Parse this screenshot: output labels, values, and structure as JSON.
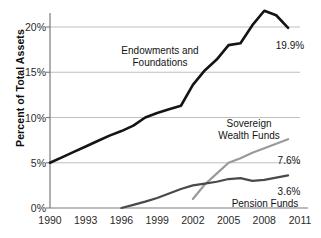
{
  "chart_data": {
    "type": "line",
    "title": "",
    "xlabel": "",
    "ylabel": "Percent of Total Assets",
    "xlim": [
      1990,
      2011
    ],
    "ylim": [
      0,
      22.6
    ],
    "grid": "horizontal",
    "legend_position": "inline-annotations",
    "xticks": [
      "1990",
      "1993",
      "1996",
      "1999",
      "2002",
      "2005",
      "2008",
      "2011"
    ],
    "xtick_values": [
      1990,
      1993,
      1996,
      1999,
      2002,
      2005,
      2008,
      2011
    ],
    "yticks": [
      "0%",
      "5%",
      "10%",
      "15%",
      "20%"
    ],
    "ytick_values": [
      0,
      5,
      10,
      15,
      20
    ],
    "series": [
      {
        "name": "Endowments and Foundations",
        "color": "#141414",
        "width": 2.6,
        "end_label": "19.9%",
        "x": [
          1990,
          1991,
          1992,
          1993,
          1994,
          1995,
          1996,
          1997,
          1998,
          1999,
          2000,
          2001,
          2002,
          2003,
          2004,
          2005,
          2006,
          2007,
          2008,
          2009,
          2010
        ],
        "values": [
          5.0,
          5.6,
          6.2,
          6.8,
          7.4,
          8.0,
          8.5,
          9.1,
          10.0,
          10.5,
          10.9,
          11.3,
          13.6,
          15.2,
          16.4,
          18.0,
          18.2,
          20.2,
          21.8,
          21.3,
          19.9
        ]
      },
      {
        "name": "Sovereign Wealth Funds",
        "color": "#9a9a9a",
        "width": 2.2,
        "end_label": "7.6%",
        "x": [
          2002,
          2003,
          2004,
          2005,
          2006,
          2007,
          2008,
          2009,
          2010
        ],
        "values": [
          1.0,
          2.6,
          3.8,
          5.0,
          5.5,
          6.1,
          6.6,
          7.1,
          7.6
        ]
      },
      {
        "name": "Pension Funds",
        "color": "#4a4a4a",
        "width": 2.2,
        "end_label": "3.6%",
        "x": [
          1996,
          1997,
          1998,
          1999,
          2000,
          2001,
          2002,
          2003,
          2004,
          2005,
          2006,
          2007,
          2008,
          2009,
          2010
        ],
        "values": [
          0.0,
          0.35,
          0.7,
          1.1,
          1.6,
          2.1,
          2.5,
          2.7,
          2.9,
          3.2,
          3.3,
          3.0,
          3.1,
          3.35,
          3.6
        ]
      }
    ],
    "annotations": [
      {
        "name": "endowments-label",
        "text": "Endowments and\nFoundations",
        "x_px": 160,
        "y_px": 45
      },
      {
        "name": "swf-label",
        "text": "Sovereign\nWealth Funds",
        "x_px": 249,
        "y_px": 118
      },
      {
        "name": "pension-label",
        "text": "Pension Funds",
        "x_px": 265,
        "y_px": 198
      },
      {
        "name": "endowments-value",
        "text": "19.9%",
        "x_px": 290,
        "y_px": 40
      },
      {
        "name": "swf-value",
        "text": "7.6%",
        "x_px": 289,
        "y_px": 155
      },
      {
        "name": "pension-value",
        "text": "3.6%",
        "x_px": 289,
        "y_px": 186
      }
    ],
    "colors": {
      "axis": "#7a7a7a",
      "grid": "#b8b8b8",
      "text": "#1a1a1a",
      "background": "#ffffff"
    }
  }
}
